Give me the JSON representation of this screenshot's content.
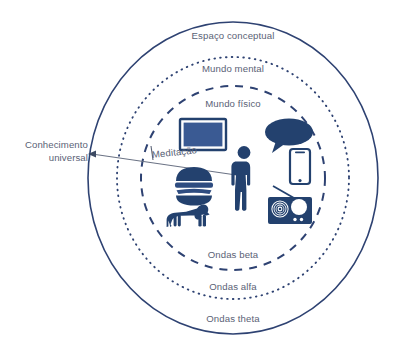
{
  "diagram": {
    "title": "Espaço conceptual",
    "palette": {
      "outline": "#2e4272",
      "ring_stroke": "#2e4272",
      "icon_dark": "#23416e",
      "icon_fill": "#3a5a93",
      "label_text": "#5a6276",
      "connector": "#6b7385",
      "background": "#ffffff"
    },
    "rings": [
      {
        "name": "espaco-conceptual",
        "label": "Espaço conceptual",
        "wave_label": "Ondas theta",
        "stroke_style": "solid"
      },
      {
        "name": "mundo-mental",
        "label": "Mundo mental",
        "wave_label": "Ondas alfa",
        "stroke_style": "dotted"
      },
      {
        "name": "mundo-fisico",
        "label": "Mundo físico",
        "wave_label": "Ondas beta",
        "stroke_style": "dashed"
      }
    ],
    "connector": {
      "label": "Conhecimento universal",
      "label_line_1": "Conhecimento",
      "label_line_2": "universal",
      "arrow_direction": "left"
    },
    "meditation": {
      "label": "Meditação"
    },
    "icons": [
      {
        "name": "television-icon",
        "label": "Televisão"
      },
      {
        "name": "speech-bubble-icon",
        "label": "Conversa"
      },
      {
        "name": "smartphone-icon",
        "label": "Telemóvel"
      },
      {
        "name": "person-icon",
        "label": "Pessoa"
      },
      {
        "name": "hamburger-icon",
        "label": "Comida"
      },
      {
        "name": "radio-icon",
        "label": "Rádio"
      },
      {
        "name": "dog-icon",
        "label": "Cão"
      }
    ]
  }
}
